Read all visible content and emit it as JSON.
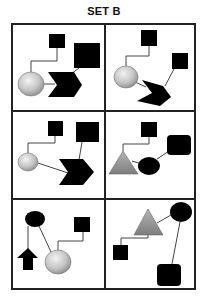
{
  "title": "SET B",
  "colors": {
    "stroke": "#333333",
    "grid": "#222222",
    "black": "#000000",
    "gray_fill_light": "#d9d9d9",
    "gray_fill_dark": "#8c8c8c"
  },
  "panels": [
    {
      "id": 1,
      "row": 1,
      "col": 1,
      "shapes": [
        "small-square",
        "large-square",
        "gray-circle",
        "black-chevron"
      ]
    },
    {
      "id": 2,
      "row": 1,
      "col": 2,
      "shapes": [
        "small-square",
        "small-square",
        "gray-circle",
        "black-chevron-rotated"
      ]
    },
    {
      "id": 3,
      "row": 2,
      "col": 1,
      "shapes": [
        "small-square",
        "large-square",
        "gray-circle",
        "black-chevron"
      ]
    },
    {
      "id": 4,
      "row": 2,
      "col": 2,
      "shapes": [
        "small-square",
        "rounded-square",
        "gray-triangle",
        "black-ellipse"
      ]
    },
    {
      "id": 5,
      "row": 3,
      "col": 1,
      "shapes": [
        "black-ellipse",
        "small-square",
        "black-up-arrow",
        "gray-circle"
      ]
    },
    {
      "id": 6,
      "row": 3,
      "col": 2,
      "shapes": [
        "gray-triangle",
        "black-ellipse",
        "small-square",
        "rounded-square"
      ]
    }
  ]
}
